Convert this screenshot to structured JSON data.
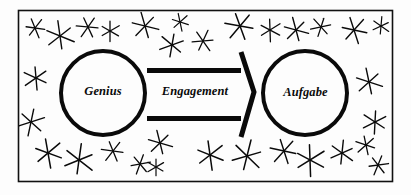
{
  "figure": {
    "type": "concept-diagram",
    "border_color": "#111111",
    "ink_color": "#0a0a0a",
    "background_color": "#fdfdfd",
    "frame": {
      "x": 18,
      "y": 10,
      "width": 374,
      "height": 171
    }
  },
  "nodes": [
    {
      "id": "genius",
      "label": "Genius",
      "shape": "circle",
      "cx": 103,
      "cy": 93,
      "r": 42,
      "stroke_width": 4
    },
    {
      "id": "aufgabe",
      "label": "Aufgabe",
      "shape": "circle",
      "cx": 305,
      "cy": 93,
      "r": 42,
      "stroke_width": 4
    }
  ],
  "connector": {
    "id": "engagement-arrow",
    "label": "Engagement",
    "style": "hollow-block-arrow",
    "direction": "left-to-right",
    "from": "genius",
    "to": "aufgabe",
    "bar_thickness": 5,
    "top_bar_y": 68,
    "bottom_bar_y": 116,
    "x_start": 147,
    "x_end": 241,
    "tip_x": 254,
    "tip_y": 92
  },
  "stars": {
    "count": 31,
    "shape": "six-pointed-asterisk",
    "stroke_color": "#0a0a0a",
    "items": [
      {
        "cx": 35,
        "cy": 28,
        "r": 9,
        "rot": 8,
        "w": 1.3
      },
      {
        "cx": 60,
        "cy": 36,
        "r": 13,
        "rot": 22,
        "w": 1.4
      },
      {
        "cx": 88,
        "cy": 27,
        "r": 10,
        "rot": 5,
        "w": 1.3
      },
      {
        "cx": 110,
        "cy": 31,
        "r": 9,
        "rot": 30,
        "w": 1.3
      },
      {
        "cx": 145,
        "cy": 26,
        "r": 12,
        "rot": 14,
        "w": 1.4
      },
      {
        "cx": 172,
        "cy": 45,
        "r": 11,
        "rot": 40,
        "w": 1.4
      },
      {
        "cx": 180,
        "cy": 22,
        "r": 8,
        "rot": 18,
        "w": 1.2
      },
      {
        "cx": 203,
        "cy": 41,
        "r": 10,
        "rot": 55,
        "w": 1.3
      },
      {
        "cx": 240,
        "cy": 26,
        "r": 13,
        "rot": 10,
        "w": 1.5
      },
      {
        "cx": 270,
        "cy": 30,
        "r": 10,
        "rot": 28,
        "w": 1.3
      },
      {
        "cx": 296,
        "cy": 30,
        "r": 11,
        "rot": 15,
        "w": 1.4
      },
      {
        "cx": 321,
        "cy": 27,
        "r": 9,
        "rot": 48,
        "w": 1.3
      },
      {
        "cx": 354,
        "cy": 30,
        "r": 12,
        "rot": 12,
        "w": 1.4
      },
      {
        "cx": 381,
        "cy": 26,
        "r": 8,
        "rot": 35,
        "w": 1.2
      },
      {
        "cx": 36,
        "cy": 78,
        "r": 11,
        "rot": 25,
        "w": 1.4
      },
      {
        "cx": 31,
        "cy": 122,
        "r": 12,
        "rot": 42,
        "w": 1.4
      },
      {
        "cx": 369,
        "cy": 82,
        "r": 12,
        "rot": 18,
        "w": 1.4
      },
      {
        "cx": 375,
        "cy": 122,
        "r": 11,
        "rot": 33,
        "w": 1.4
      },
      {
        "cx": 48,
        "cy": 153,
        "r": 13,
        "rot": 20,
        "w": 1.5
      },
      {
        "cx": 79,
        "cy": 160,
        "r": 14,
        "rot": 38,
        "w": 1.5
      },
      {
        "cx": 113,
        "cy": 151,
        "r": 10,
        "rot": 8,
        "w": 1.3
      },
      {
        "cx": 140,
        "cy": 164,
        "r": 9,
        "rot": 50,
        "w": 1.3
      },
      {
        "cx": 160,
        "cy": 143,
        "r": 11,
        "rot": 16,
        "w": 1.4
      },
      {
        "cx": 156,
        "cy": 167,
        "r": 8,
        "rot": 30,
        "w": 1.2
      },
      {
        "cx": 210,
        "cy": 155,
        "r": 13,
        "rot": 22,
        "w": 1.5
      },
      {
        "cx": 247,
        "cy": 156,
        "r": 14,
        "rot": 44,
        "w": 1.5
      },
      {
        "cx": 284,
        "cy": 151,
        "r": 12,
        "rot": 12,
        "w": 1.4
      },
      {
        "cx": 310,
        "cy": 160,
        "r": 14,
        "rot": 28,
        "w": 1.5
      },
      {
        "cx": 342,
        "cy": 153,
        "r": 11,
        "rot": 36,
        "w": 1.4
      },
      {
        "cx": 366,
        "cy": 145,
        "r": 9,
        "rot": 18,
        "w": 1.3
      },
      {
        "cx": 378,
        "cy": 165,
        "r": 9,
        "rot": 52,
        "w": 1.3
      }
    ]
  }
}
